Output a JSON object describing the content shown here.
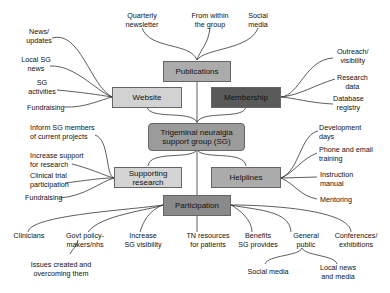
{
  "diagram": {
    "center": {
      "label": "Trigeminal neuralgia support group (SG)",
      "lines": [
        "Trigeminal neuralgia",
        "support group (SG)"
      ],
      "color": "#9b9b9b"
    },
    "nodes": {
      "publications": {
        "label": "Publications",
        "color": "#ababab"
      },
      "website": {
        "label": "Website",
        "color": "#d2d2d2"
      },
      "membership": {
        "label": "Membership",
        "color": "#5a5a5a"
      },
      "supporting_research": {
        "lines": [
          "Supporting",
          "research"
        ],
        "color": "#d4d4d4"
      },
      "helplines": {
        "label": "Helplines",
        "color": "#ababab"
      },
      "participation": {
        "label": "Participation",
        "color": "#8a8a8a"
      }
    },
    "publications_leaves": [
      {
        "lines": [
          "Quarterly",
          "newsletter"
        ]
      },
      {
        "lines": [
          "From within",
          "the group"
        ]
      },
      {
        "lines": [
          "Social",
          "media"
        ]
      }
    ],
    "website_leaves": [
      {
        "lines": [
          "News/",
          "updates"
        ]
      },
      {
        "lines": [
          "Local SG",
          "news"
        ]
      },
      {
        "lines": [
          "SG",
          "activities"
        ]
      },
      {
        "lines": [
          "Fundraising"
        ]
      }
    ],
    "membership_leaves": [
      {
        "lines": [
          "Outreach/",
          "visibility"
        ]
      },
      {
        "lines": [
          "Research",
          "data"
        ]
      },
      {
        "lines": [
          "Database",
          "registry"
        ]
      }
    ],
    "research_leaves": [
      {
        "lines": [
          "Inform SG members",
          "of current projects"
        ]
      },
      {
        "lines": [
          "Increase support",
          "for research"
        ]
      },
      {
        "lines": [
          "Clinical trial",
          "participation"
        ]
      },
      {
        "lines": [
          "Fundraising"
        ]
      }
    ],
    "helplines_leaves": [
      {
        "lines": [
          "Development",
          "days"
        ]
      },
      {
        "lines": [
          "Phone and email",
          "training"
        ]
      },
      {
        "lines": [
          "Instruction",
          "manual"
        ]
      },
      {
        "lines": [
          "Mentoring"
        ]
      }
    ],
    "participation_leaves": [
      {
        "lines": [
          "Clinicians"
        ]
      },
      {
        "lines": [
          "Govt policy-",
          "makers/nhs"
        ]
      },
      {
        "lines": [
          "Increase",
          "SG visibility"
        ]
      },
      {
        "lines": [
          "TN resources",
          "for patients"
        ]
      },
      {
        "lines": [
          "Benefits",
          "SG provides"
        ]
      },
      {
        "lines": [
          "General",
          "public"
        ]
      },
      {
        "lines": [
          "Conferences/",
          "exhibitions"
        ]
      }
    ],
    "sub_leaves": {
      "govt": {
        "lines": [
          "Issues created and",
          "overcoming them"
        ]
      },
      "public_1": {
        "lines": [
          "Social media"
        ]
      },
      "public_2": {
        "lines": [
          "Local news",
          "and media"
        ]
      }
    }
  }
}
